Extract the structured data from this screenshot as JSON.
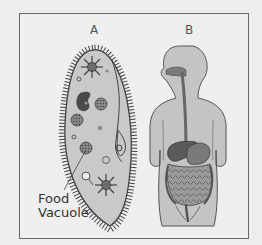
{
  "figure": {
    "panels": [
      {
        "id": "A",
        "label": "A",
        "subject": "paramecium (single-celled organism)"
      },
      {
        "id": "B",
        "label": "B",
        "subject": "human digestive system"
      }
    ],
    "callouts": [
      {
        "line1": "Food",
        "line2": "Vacuole",
        "target": "A"
      }
    ]
  },
  "colors": {
    "background": "#ededed",
    "frame": "#6a6a6a",
    "cell_fill": "#c9c9c9",
    "body_fill": "#c4c4c4",
    "organ_dark": "#5a5a5a",
    "outline": "#444444"
  }
}
